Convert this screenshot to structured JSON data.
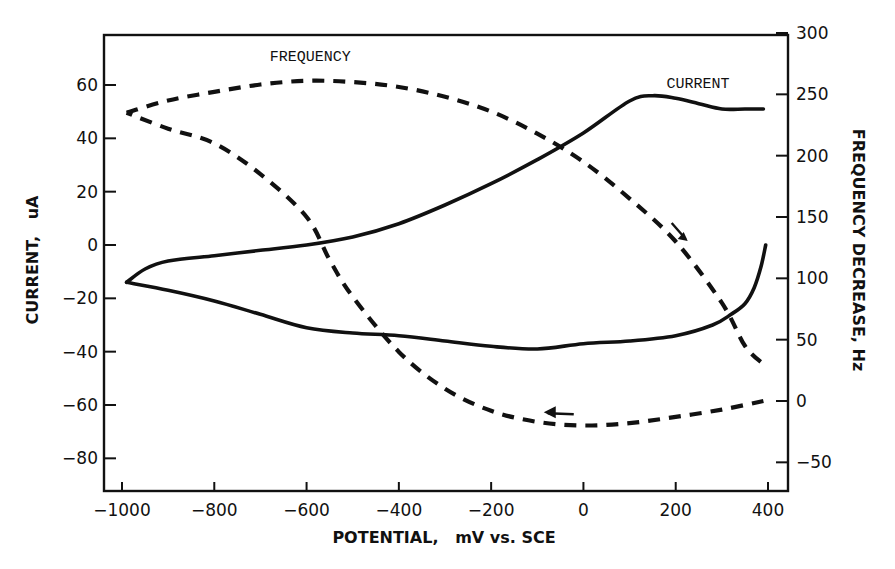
{
  "chart_data": {
    "type": "line",
    "title": "",
    "xlabel": "POTENTIAL,   mV vs. SCE",
    "ylabel": "CURRENT,   uA",
    "ylabel_right": "FREQUENCY DECREASE, Hz",
    "xlim": [
      -1040,
      420
    ],
    "ylim": [
      -92,
      80
    ],
    "ylim_right": [
      -70,
      300
    ],
    "grid": false,
    "x_ticks": [
      -1000,
      -800,
      -600,
      -400,
      -200,
      0,
      200,
      400
    ],
    "x_tick_labels": [
      "−1000",
      "−800",
      "−600",
      "−400",
      "−200",
      "0",
      "200",
      "400"
    ],
    "y_ticks": [
      60,
      40,
      20,
      0,
      -20,
      -40,
      -60,
      -80
    ],
    "y_tick_labels": [
      "60",
      "40",
      "20",
      "0",
      "−20",
      "−40",
      "−60",
      "−80"
    ],
    "y_right_ticks": [
      300,
      250,
      200,
      150,
      100,
      50,
      0,
      -50
    ],
    "y_right_tick_labels": [
      "300",
      "250",
      "200",
      "150",
      "100",
      "50",
      "0",
      "−50"
    ],
    "annotations": [
      {
        "text": "FREQUENCY",
        "x": -680,
        "y": 69
      },
      {
        "text": "CURRENT",
        "x": 180,
        "y": 59
      }
    ],
    "series": [
      {
        "name": "CURRENT (anodic sweep)",
        "axis": "left",
        "style": "solid",
        "x": [
          -990,
          -950,
          -900,
          -800,
          -700,
          -600,
          -500,
          -400,
          -300,
          -200,
          -100,
          0,
          100,
          150,
          200,
          250,
          300,
          350,
          390
        ],
        "y": [
          -14,
          -9,
          -6,
          -4,
          -2,
          0,
          3,
          8,
          15,
          23,
          32,
          42,
          54,
          56,
          55,
          53,
          51,
          51,
          51
        ]
      },
      {
        "name": "CURRENT (cathodic sweep)",
        "axis": "left",
        "style": "solid",
        "x": [
          395,
          385,
          370,
          350,
          320,
          280,
          200,
          100,
          0,
          -100,
          -200,
          -300,
          -400,
          -500,
          -600,
          -700,
          -800,
          -900,
          -990
        ],
        "y": [
          0,
          -8,
          -16,
          -22,
          -26,
          -30,
          -34,
          -36,
          -37,
          -39,
          -38,
          -36,
          -34,
          -33,
          -31,
          -26,
          -21,
          -17,
          -14
        ]
      },
      {
        "name": "FREQUENCY (anodic sweep)",
        "axis": "right",
        "style": "dashed",
        "x": [
          -990,
          -900,
          -800,
          -700,
          -600,
          -500,
          -400,
          -300,
          -200,
          -100,
          0,
          100,
          200,
          300,
          350,
          390
        ],
        "y": [
          235,
          245,
          252,
          258,
          261,
          260,
          256,
          248,
          236,
          218,
          195,
          165,
          130,
          80,
          45,
          30
        ]
      },
      {
        "name": "FREQUENCY (cathodic sweep)",
        "axis": "right",
        "style": "dashed",
        "x": [
          390,
          300,
          200,
          100,
          0,
          -100,
          -200,
          -300,
          -400,
          -500,
          -550,
          -600,
          -700,
          -800,
          -900,
          -990
        ],
        "y": [
          0,
          -7,
          -13,
          -18,
          -20,
          -17,
          -8,
          10,
          40,
          85,
          115,
          150,
          185,
          210,
          222,
          235
        ]
      }
    ],
    "direction_arrows": [
      {
        "x": 200,
        "y_right": 132,
        "direction": "down-right"
      },
      {
        "x": -60,
        "y_right": -10,
        "direction": "left"
      }
    ]
  }
}
